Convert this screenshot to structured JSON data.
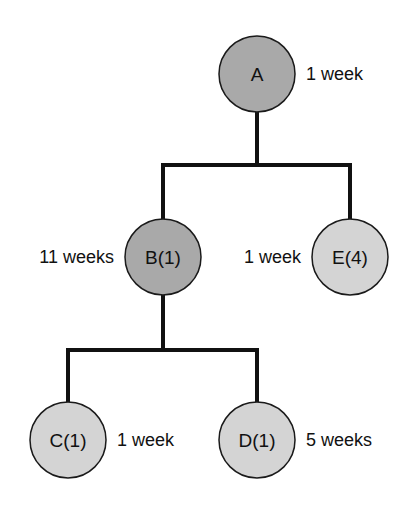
{
  "diagram": {
    "type": "tree",
    "colors": {
      "dark_node": "#a9a9a9",
      "light_node": "#d4d4d4",
      "stroke": "#1a1a1a",
      "line": "#111111"
    },
    "nodes": [
      {
        "id": "A",
        "label": "A",
        "duration": "1 week",
        "shade": "dark"
      },
      {
        "id": "B",
        "label": "B(1)",
        "duration": "11 weeks",
        "shade": "dark"
      },
      {
        "id": "E",
        "label": "E(4)",
        "duration": "1 week",
        "shade": "light"
      },
      {
        "id": "C",
        "label": "C(1)",
        "duration": "1 week",
        "shade": "light"
      },
      {
        "id": "D",
        "label": "D(1)",
        "duration": "5 weeks",
        "shade": "light"
      }
    ],
    "edges": [
      {
        "from": "A",
        "to": "B"
      },
      {
        "from": "A",
        "to": "E"
      },
      {
        "from": "B",
        "to": "C"
      },
      {
        "from": "B",
        "to": "D"
      }
    ]
  }
}
